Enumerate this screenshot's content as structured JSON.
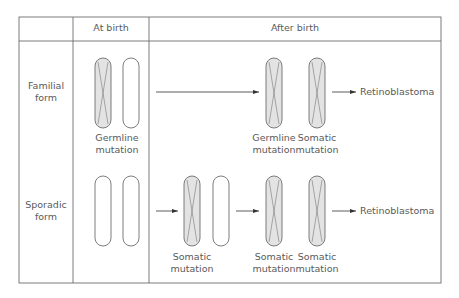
{
  "header": {
    "columns": [
      "",
      "At birth",
      "After birth"
    ]
  },
  "rows": [
    {
      "label": "Familial form",
      "label_lines": [
        "Familial",
        "form"
      ],
      "at_birth": {
        "chromosomes": [
          {
            "mutated": true
          },
          {
            "mutated": false
          }
        ],
        "caption_lines": [
          "Germline",
          "mutation"
        ]
      },
      "after_birth": {
        "chromosomes": [
          {
            "mutated": true,
            "caption_lines": [
              "Germline",
              "mutation"
            ]
          },
          {
            "mutated": true,
            "caption_lines": [
              "Somatic",
              "mutation"
            ]
          }
        ],
        "outcome": "Retinoblastoma"
      }
    },
    {
      "label": "Sporadic form",
      "label_lines": [
        "Sporadic",
        "form"
      ],
      "at_birth": {
        "chromosomes": [
          {
            "mutated": false
          },
          {
            "mutated": false
          }
        ],
        "caption_lines": []
      },
      "intermediate": {
        "chromosomes": [
          {
            "mutated": true
          },
          {
            "mutated": false
          }
        ],
        "caption_lines": [
          "Somatic",
          "mutation"
        ]
      },
      "after_birth": {
        "chromosomes": [
          {
            "mutated": true,
            "caption_lines": [
              "Somatic",
              "mutation"
            ]
          },
          {
            "mutated": true,
            "caption_lines": [
              "Somatic",
              "mutation"
            ]
          }
        ],
        "outcome": "Retinoblastoma"
      }
    }
  ],
  "colors": {
    "border": "#6e6e6e",
    "mutated_fill": "#e3e3e3",
    "text": "#5a5a5a"
  }
}
